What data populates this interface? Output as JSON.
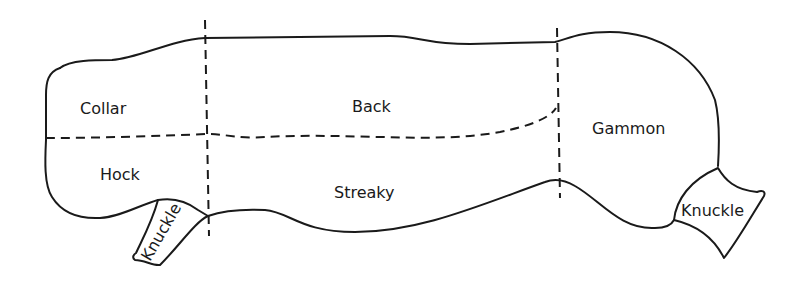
{
  "diagram": {
    "type": "cuts-of-bacon-side",
    "colors": {
      "ink": "#1a1a1a",
      "background": "#ffffff"
    },
    "regions": [
      {
        "id": "collar",
        "label": "Collar",
        "x": 80,
        "y": 114
      },
      {
        "id": "back",
        "label": "Back",
        "x": 352,
        "y": 112
      },
      {
        "id": "hock",
        "label": "Hock",
        "x": 100,
        "y": 180
      },
      {
        "id": "streaky",
        "label": "Streaky",
        "x": 334,
        "y": 198
      },
      {
        "id": "gammon",
        "label": "Gammon",
        "x": 592,
        "y": 134
      },
      {
        "id": "knuckle-left",
        "label": "Knuckle",
        "x": 170,
        "y": 232,
        "rotate": -60
      },
      {
        "id": "knuckle-right",
        "label": "Knuckle",
        "x": 681,
        "y": 216,
        "rotate": 0
      }
    ]
  }
}
